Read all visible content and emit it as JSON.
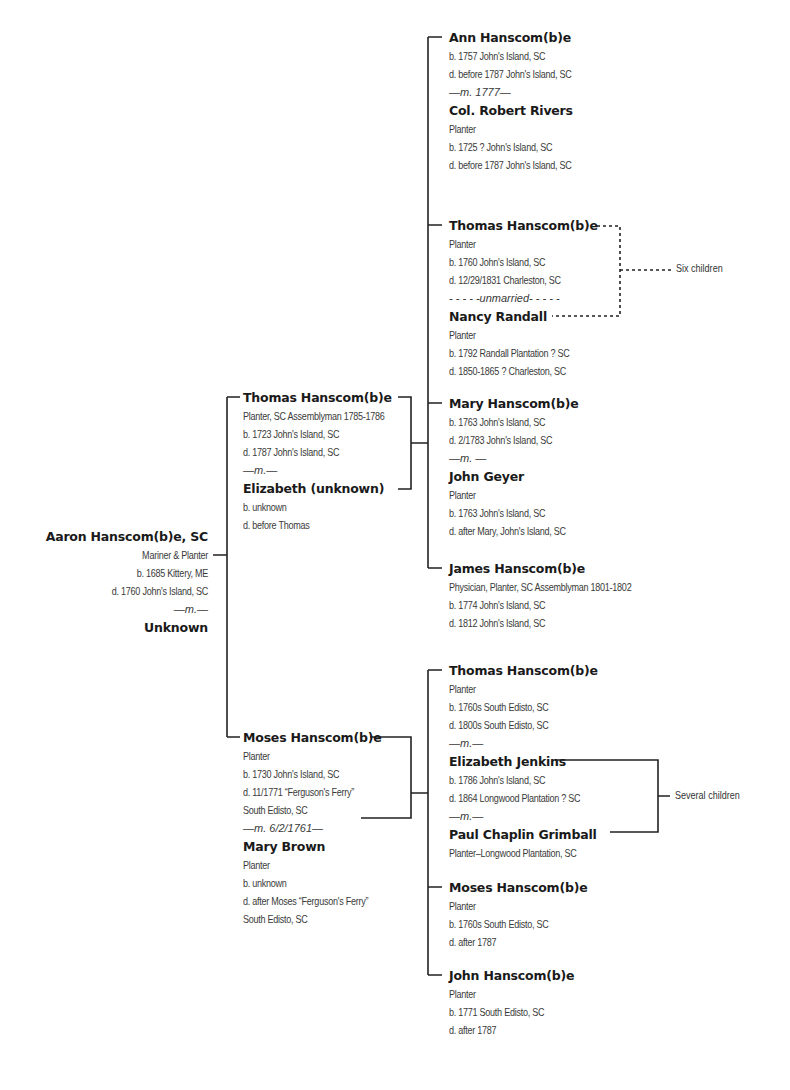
{
  "root": {
    "name": "Aaron Hanscom(b)e, SC",
    "details": [
      "Mariner & Planter",
      "b. 1685 Kittery, ME",
      "d. 1760 John's Island, SC"
    ],
    "marriage": "—m.—",
    "spouse": "Unknown"
  },
  "gen2": [
    {
      "name": "Thomas Hanscom(b)e",
      "details": [
        "Planter, SC Assemblyman 1785-1786",
        "b. 1723 John's Island, SC",
        "d. 1787 John's Island, SC"
      ],
      "marriage": "—m.—",
      "spouse": "Elizabeth (unknown)",
      "spouse_details": [
        "b. unknown",
        "d. before Thomas"
      ]
    },
    {
      "name": "Moses Hanscom(b)e",
      "details": [
        "Planter",
        "b. 1730 John's Island, SC",
        "d. 11/1771 “Ferguson's Ferry”",
        "South Edisto, SC"
      ],
      "marriage": "—m. 6/2/1761—",
      "spouse": "Mary Brown",
      "spouse_details": [
        "Planter",
        "b. unknown",
        "d. after Moses “Ferguson's Ferry”",
        "South Edisto, SC"
      ]
    }
  ],
  "gen3_thomas": [
    {
      "name": "Ann Hanscom(b)e",
      "details": [
        "b. 1757 John's Island, SC",
        "d. before 1787 John's Island, SC"
      ],
      "marriage": "—m. 1777—",
      "spouse": "Col. Robert Rivers",
      "spouse_details": [
        "Planter",
        "b. 1725 ? John's Island, SC",
        "d. before 1787 John's Island, SC"
      ]
    },
    {
      "name": "Thomas Hanscom(b)e",
      "details": [
        "Planter",
        "b. 1760 John's Island, SC",
        "d. 12/29/1831 Charleston, SC"
      ],
      "marriage": "- - - - -unmarried- - - - -",
      "spouse": "Nancy Randall",
      "spouse_details": [
        "Planter",
        "b. 1792 Randall Plantation ? SC",
        "d. 1850-1865 ? Charleston, SC"
      ],
      "children_note": "Six children"
    },
    {
      "name": "Mary Hanscom(b)e",
      "details": [
        "b. 1763 John's Island, SC",
        "d. 2/1783 John's Island, SC"
      ],
      "marriage": "—m. —",
      "spouse": "John Geyer",
      "spouse_details": [
        "Planter",
        "b. 1763 John's Island, SC",
        "d. after Mary, John's Island, SC"
      ]
    },
    {
      "name": "James Hanscom(b)e",
      "details": [
        "Physician, Planter, SC Assemblyman 1801-1802",
        "b. 1774 John's Island, SC",
        "d. 1812 John's Island, SC"
      ]
    }
  ],
  "gen3_moses": [
    {
      "name": "Thomas Hanscom(b)e",
      "details": [
        "Planter",
        "b. 1760s South Edisto, SC",
        "d. 1800s South Edisto, SC"
      ],
      "marriage": "—m.—",
      "spouse": "Elizabeth Jenkins",
      "spouse_details": [
        "b. 1786 John's Island, SC",
        "d. 1864 Longwood Plantation ? SC"
      ],
      "marriage2": "—m.—",
      "spouse2": "Paul Chaplin Grimball",
      "spouse2_details": [
        "Planter–Longwood Plantation, SC"
      ],
      "children_note": "Several children"
    },
    {
      "name": "Moses Hanscom(b)e",
      "details": [
        "Planter",
        "b. 1760s South Edisto, SC",
        "d. after 1787"
      ]
    },
    {
      "name": "John Hanscom(b)e",
      "details": [
        "Planter",
        "b. 1771 South Edisto, SC",
        "d. after 1787"
      ]
    }
  ],
  "colors": {
    "line": "#222222",
    "name": "#1a1a1a",
    "text": "#3a3a3a",
    "background": "#ffffff"
  }
}
